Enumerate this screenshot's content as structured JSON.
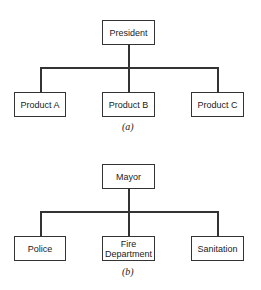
{
  "diagrams": [
    {
      "root": "President",
      "children": [
        "Product A",
        "Product B",
        "Product C"
      ],
      "caption": "(a)"
    },
    {
      "root": "Mayor",
      "children": [
        "Police",
        "Fire Department",
        "Sanitation"
      ],
      "caption": "(b)"
    }
  ]
}
